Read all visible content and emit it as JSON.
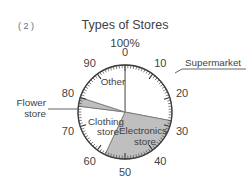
{
  "figure": {
    "number_label": "( 2 )",
    "title": "Types of Stores",
    "top_unit_label": "100%"
  },
  "axis": {
    "tick_labels": [
      "0",
      "10",
      "20",
      "30",
      "40",
      "50",
      "60",
      "70",
      "80",
      "90"
    ],
    "tick_values": [
      0,
      10,
      20,
      30,
      40,
      50,
      60,
      70,
      80,
      90
    ],
    "minor_tick_step": 1,
    "major_tick_step": 10,
    "direction": "clockwise",
    "start_at_top": true
  },
  "slices": {
    "supermarket": {
      "label": "Supermarket",
      "start": 0,
      "end": 28,
      "value": 28,
      "fill": "white",
      "label_placement": "outside-leader"
    },
    "electronics": {
      "label_line1": "Electronics",
      "label_line2": "store",
      "label": "Electronics store",
      "start": 28,
      "end": 57,
      "value": 29,
      "fill": "gray",
      "label_placement": "inside"
    },
    "clothing": {
      "label_line1": "Clothing",
      "label_line2": "store",
      "label": "Clothing store",
      "start": 57,
      "end": 77,
      "value": 20,
      "fill": "white",
      "label_placement": "inside"
    },
    "flower": {
      "label_line1": "Flower",
      "label_line2": "store",
      "label": "Flower store",
      "start": 77,
      "end": 80,
      "value": 3,
      "fill": "gray",
      "label_placement": "outside-leader"
    },
    "other": {
      "label": "Other",
      "start": 80,
      "end": 100,
      "value": 20,
      "fill": "white",
      "label_placement": "inside"
    }
  },
  "colors": {
    "shaded_fill": "#bfbfbf",
    "plain_fill": "#ffffff",
    "outline": "#3c3c3c",
    "text": "#3f3f3f",
    "background": "#ffffff"
  },
  "chart_data": {
    "type": "pie",
    "title": "Types of Stores",
    "xlabel": "",
    "ylabel": "",
    "unit": "%",
    "total": 100,
    "categories": [
      "Supermarket",
      "Electronics store",
      "Clothing store",
      "Flower store",
      "Other"
    ],
    "values": [
      28,
      29,
      20,
      3,
      20
    ],
    "cumulative_starts": [
      0,
      28,
      57,
      77,
      80
    ],
    "cumulative_ends": [
      28,
      57,
      77,
      80,
      100
    ],
    "slice_fills": [
      "white",
      "gray",
      "white",
      "gray",
      "white"
    ],
    "axis_tick_labels": [
      "0",
      "10",
      "20",
      "30",
      "40",
      "50",
      "60",
      "70",
      "80",
      "90"
    ],
    "axis_top_label": "100%",
    "grid": false,
    "legend": "none",
    "annotations": [
      "( 2 )"
    ]
  }
}
